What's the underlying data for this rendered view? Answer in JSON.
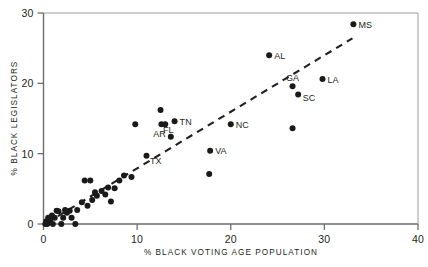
{
  "chart_data": {
    "type": "scatter",
    "title": "",
    "xlabel": "% BLACK VOTING AGE POPULATION",
    "ylabel": "% BLACK LEGISLATORS",
    "xlim": [
      0,
      40
    ],
    "ylim": [
      0,
      30
    ],
    "xticks": [
      0,
      10,
      20,
      30,
      40
    ],
    "yticks": [
      0,
      10,
      20,
      30
    ],
    "xtick_labels": [
      "0",
      "10",
      "20",
      "30",
      "40"
    ],
    "ytick_labels": [
      "0",
      "10",
      "20",
      "30"
    ],
    "grid": false,
    "legend": "none",
    "marker": "filled-circle",
    "marker_color": "#1a1a1a",
    "trend_line": {
      "style": "dashed",
      "color": "#231f20",
      "x_start": 0.4,
      "y_start": 0.2,
      "x_end": 33.0,
      "y_end": 26.4
    },
    "points": [
      {
        "label": "MS",
        "x": 33.1,
        "y": 28.4
      },
      {
        "label": "AL",
        "x": 24.1,
        "y": 24.0
      },
      {
        "label": "LA",
        "x": 29.8,
        "y": 20.6
      },
      {
        "label": "GA",
        "x": 26.6,
        "y": 19.6
      },
      {
        "label": "SC",
        "x": 27.2,
        "y": 18.4
      },
      {
        "label": "NC",
        "x": 20.0,
        "y": 14.2
      },
      {
        "label": "TN",
        "x": 14.0,
        "y": 14.6
      },
      {
        "label": "FL",
        "x": 12.6,
        "y": 14.2
      },
      {
        "label": "AR",
        "x": 13.6,
        "y": 12.4
      },
      {
        "label": "TX",
        "x": 11.0,
        "y": 9.7
      },
      {
        "label": "VA",
        "x": 17.8,
        "y": 10.4
      },
      {
        "label": "",
        "x": 12.5,
        "y": 16.2
      },
      {
        "label": "",
        "x": 9.8,
        "y": 14.2
      },
      {
        "label": "",
        "x": 13.0,
        "y": 14.2
      },
      {
        "label": "",
        "x": 26.6,
        "y": 13.6
      },
      {
        "label": "",
        "x": 17.7,
        "y": 7.1
      },
      {
        "label": "",
        "x": 9.4,
        "y": 6.7
      },
      {
        "label": "",
        "x": 8.6,
        "y": 6.9
      },
      {
        "label": "",
        "x": 8.1,
        "y": 6.2
      },
      {
        "label": "",
        "x": 7.6,
        "y": 5.1
      },
      {
        "label": "",
        "x": 7.2,
        "y": 3.2
      },
      {
        "label": "",
        "x": 6.6,
        "y": 4.2
      },
      {
        "label": "",
        "x": 6.9,
        "y": 5.2
      },
      {
        "label": "",
        "x": 6.2,
        "y": 4.7
      },
      {
        "label": "",
        "x": 5.7,
        "y": 4.0
      },
      {
        "label": "",
        "x": 5.5,
        "y": 4.5
      },
      {
        "label": "",
        "x": 5.2,
        "y": 3.4
      },
      {
        "label": "",
        "x": 5.0,
        "y": 6.2
      },
      {
        "label": "",
        "x": 4.4,
        "y": 6.2
      },
      {
        "label": "",
        "x": 4.7,
        "y": 2.6
      },
      {
        "label": "",
        "x": 4.1,
        "y": 3.1
      },
      {
        "label": "",
        "x": 3.6,
        "y": 2.0
      },
      {
        "label": "",
        "x": 3.4,
        "y": 0.0
      },
      {
        "label": "",
        "x": 3.0,
        "y": 0.9
      },
      {
        "label": "",
        "x": 2.8,
        "y": 1.9
      },
      {
        "label": "",
        "x": 2.5,
        "y": 1.6
      },
      {
        "label": "",
        "x": 2.3,
        "y": 2.0
      },
      {
        "label": "",
        "x": 2.1,
        "y": 0.9
      },
      {
        "label": "",
        "x": 1.9,
        "y": 0.0
      },
      {
        "label": "",
        "x": 1.6,
        "y": 1.8
      },
      {
        "label": "",
        "x": 1.4,
        "y": 1.9
      },
      {
        "label": "",
        "x": 1.2,
        "y": 0.9
      },
      {
        "label": "",
        "x": 1.0,
        "y": 0.0
      },
      {
        "label": "",
        "x": 0.9,
        "y": 1.2
      },
      {
        "label": "",
        "x": 0.7,
        "y": 0.5
      },
      {
        "label": "",
        "x": 0.5,
        "y": 0.9
      },
      {
        "label": "",
        "x": 0.4,
        "y": 0.0
      },
      {
        "label": "",
        "x": 0.3,
        "y": 0.4
      },
      {
        "label": "",
        "x": 0.2,
        "y": 0.0
      }
    ]
  }
}
